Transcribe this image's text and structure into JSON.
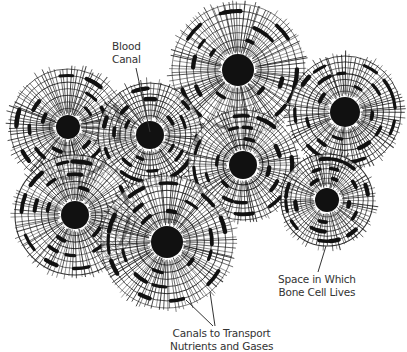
{
  "diagram": {
    "background": "#ffffff",
    "ink_color": "#111111",
    "osteons": [
      {
        "id": "top-center",
        "cx": 238,
        "cy": 70,
        "r": 66,
        "canal_r": 16
      },
      {
        "id": "left",
        "cx": 68,
        "cy": 127,
        "r": 58,
        "canal_r": 12
      },
      {
        "id": "center-left",
        "cx": 150,
        "cy": 135,
        "r": 52,
        "canal_r": 14
      },
      {
        "id": "right",
        "cx": 345,
        "cy": 112,
        "r": 56,
        "canal_r": 15
      },
      {
        "id": "center",
        "cx": 243,
        "cy": 165,
        "r": 55,
        "canal_r": 14
      },
      {
        "id": "lower-left",
        "cx": 75,
        "cy": 215,
        "r": 60,
        "canal_r": 14
      },
      {
        "id": "bottom-center",
        "cx": 167,
        "cy": 242,
        "r": 66,
        "canal_r": 16
      },
      {
        "id": "lower-right",
        "cx": 327,
        "cy": 200,
        "r": 46,
        "canal_r": 12
      }
    ],
    "labels": {
      "blood_canal": {
        "line1": "Blood",
        "line2": "Canal"
      },
      "bone_cell_space": {
        "line1": "Space in Which",
        "line2": "Bone Cell Lives"
      },
      "canals_transport": {
        "line1": "Canals to Transport",
        "line2": "Nutrients and Gases"
      }
    },
    "pointers": [
      {
        "target": "blood_canal",
        "x1": 136,
        "y1": 68,
        "x2": 150,
        "y2": 132
      },
      {
        "target": "bone_cell_space",
        "x1": 318,
        "y1": 272,
        "x2": 326,
        "y2": 246
      },
      {
        "target": "canals_transport",
        "x1": 215,
        "y1": 326,
        "x2": 210,
        "y2": 292
      },
      {
        "target": "canals_transport",
        "x1": 213,
        "y1": 326,
        "x2": 186,
        "y2": 300
      }
    ]
  }
}
